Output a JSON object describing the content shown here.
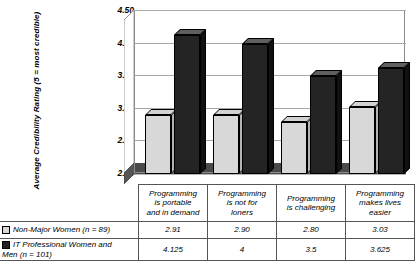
{
  "chart_data": {
    "type": "bar",
    "title": "",
    "xlabel": "",
    "ylabel": "Average Credibility Rating (5 = most credible)",
    "ylim": [
      2.0,
      4.5
    ],
    "yticks": [
      "2.00",
      "2.50",
      "3.00",
      "3.50",
      "4.00",
      "4.50"
    ],
    "ytick_values": [
      2.0,
      2.5,
      3.0,
      3.5,
      4.0,
      4.5
    ],
    "grid": true,
    "legend_position": "data-table-below",
    "categories": [
      "Programming is portable and in demand",
      "Programming is not for loners",
      "Programming is challenging",
      "Programming makes lives easier"
    ],
    "category_lines": [
      [
        "Programming",
        "is portable",
        "and in demand"
      ],
      [
        "Programming",
        "is not for",
        "loners"
      ],
      [
        "Programming",
        "is challenging"
      ],
      [
        "Programming",
        "makes lives",
        "easier"
      ]
    ],
    "series": [
      {
        "name": "Non-Major Women (n = 89)",
        "color": "#d8d8d8",
        "values": [
          2.91,
          2.9,
          2.8,
          3.03
        ],
        "labels": [
          "2.91",
          "2.90",
          "2.80",
          "3.03"
        ]
      },
      {
        "name": "IT Professional Women and Men (n = 101)",
        "name_lines": [
          "IT Professional Women and",
          "Men (n = 101)"
        ],
        "color": "#242424",
        "values": [
          4.125,
          4,
          3.5,
          3.625
        ],
        "labels": [
          "4.125",
          "4",
          "3.5",
          "3.625"
        ]
      }
    ]
  }
}
